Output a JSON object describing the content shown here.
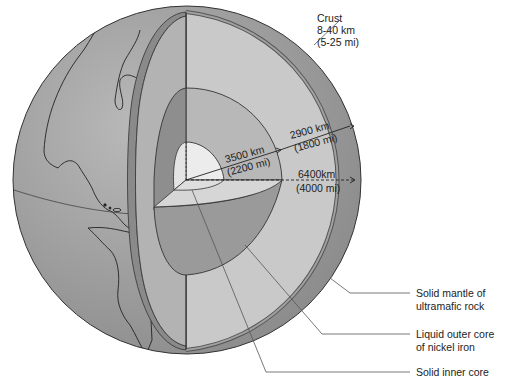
{
  "diagram": {
    "colors": {
      "background": "#ffffff",
      "globe_surface": "#9a9a9a",
      "crust": "#7f7f7f",
      "mantle": "#c6c6c6",
      "outer_core_light": "#a8a8a8",
      "outer_core_dark": "#8c8c8c",
      "inner_core": "#ececec",
      "outline": "#333333"
    },
    "labels": {
      "crust": {
        "name": "Crust",
        "range_km": "8-40 km",
        "range_mi": "(5-25 mi)"
      },
      "mantle_thickness": {
        "km": "2900 km",
        "mi": "(1800 mi)"
      },
      "core_radius": {
        "km": "3500 km",
        "mi": "(2200 mi)"
      },
      "earth_radius": {
        "km": "6400km",
        "mi": "(4000 mi)"
      },
      "mantle": {
        "line1": "Solid mantle of",
        "line2": "ultramafic rock"
      },
      "outer_core": {
        "line1": "Liquid outer core",
        "line2": "of nickel iron"
      },
      "inner_core": {
        "line1": "Solid inner core"
      }
    }
  }
}
